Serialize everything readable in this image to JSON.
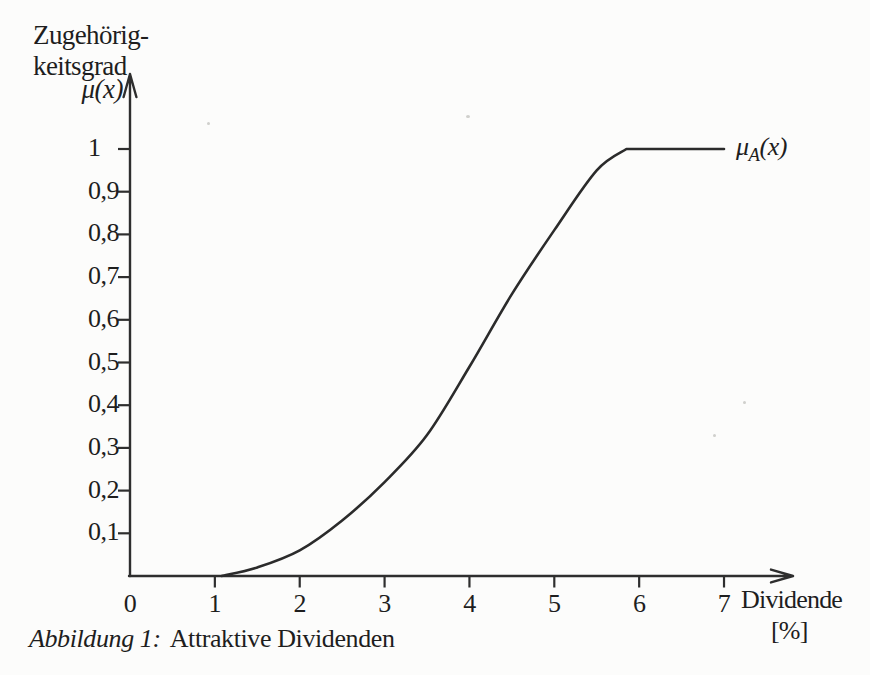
{
  "caption": {
    "label": "Abbildung 1:",
    "text": "Attraktive Dividenden"
  },
  "colors": {
    "background": "#fcfcfb",
    "ink": "#1e1e1e",
    "axis": "#2e2e2e",
    "curve": "#2b2b2b"
  },
  "chart_data": {
    "type": "line",
    "xlabel": "Dividende [%]",
    "ylabel": "Zugehörigkeitsgrad μ(x)",
    "xlim": [
      0,
      7.8
    ],
    "ylim": [
      0,
      1.12
    ],
    "grid": false,
    "legend": "curve-end-label",
    "y_axis_header": {
      "line1": "Zugehörig-",
      "line2": "keitsgrad",
      "symbol": "μ(x)"
    },
    "x_axis": {
      "title_line1": "Dividende",
      "title_line2": "[%]",
      "labels": [
        "0",
        "1",
        "2",
        "3",
        "4",
        "5",
        "6",
        "7"
      ],
      "label_values": [
        0,
        1,
        2,
        3,
        4,
        5,
        6,
        7
      ],
      "tick_values": [
        1,
        2,
        3,
        4,
        5,
        6,
        7
      ]
    },
    "y_axis": {
      "labels": [
        "0,1",
        "0,2",
        "0,3",
        "0,4",
        "0,5",
        "0,6",
        "0,7",
        "0,8",
        "0,9",
        "1"
      ],
      "tick_values": [
        0.1,
        0.2,
        0.3,
        0.4,
        0.5,
        0.6,
        0.7,
        0.8,
        0.9,
        1.0
      ]
    },
    "series": [
      {
        "name": "μA(x)",
        "label": {
          "base": "μ",
          "sub": "A",
          "rest": "(x)"
        },
        "color": "#2b2b2b",
        "plateau_from": 5.85,
        "points": [
          [
            1.08,
            0
          ],
          [
            1.5,
            0.02
          ],
          [
            2,
            0.06
          ],
          [
            2.5,
            0.13
          ],
          [
            3,
            0.22
          ],
          [
            3.5,
            0.33
          ],
          [
            4,
            0.49
          ],
          [
            4.5,
            0.66
          ],
          [
            5,
            0.81
          ],
          [
            5.5,
            0.95
          ],
          [
            5.85,
            1.0
          ],
          [
            7.0,
            1.0
          ]
        ]
      }
    ]
  }
}
